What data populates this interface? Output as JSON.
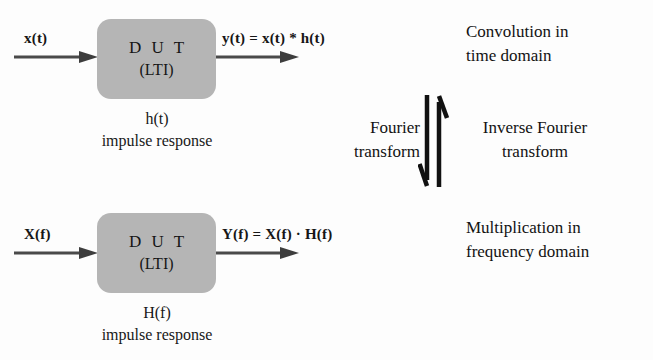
{
  "diagram": {
    "colors": {
      "block_fill": "#b5b5b5",
      "arrow": "#3a3a3a",
      "text": "#1a1a1a",
      "background": "#fdfdfd"
    },
    "time_domain": {
      "input_label": "x(t)",
      "block_title": "D U T",
      "block_subtitle": "(LTI)",
      "output_label": "y(t) = x(t) * h(t)",
      "caption_line1": "h(t)",
      "caption_line2": "impulse response",
      "side_note_line1": "Convolution in",
      "side_note_line2": "time domain"
    },
    "frequency_domain": {
      "input_label": "X(f)",
      "block_title": "D U T",
      "block_subtitle": "(LTI)",
      "output_label": "Y(f) = X(f) · H(f)",
      "caption_line1": "H(f)",
      "caption_line2": "impulse response",
      "side_note_line1": "Multiplication in",
      "side_note_line2": "frequency domain"
    },
    "transform": {
      "forward_line1": "Fourier",
      "forward_line2": "transform",
      "inverse_line1": "Inverse Fourier",
      "inverse_line2": "transform",
      "down_arrow_name": "fourier-transform-down-arrow",
      "up_arrow_name": "inverse-fourier-transform-up-arrow"
    }
  }
}
